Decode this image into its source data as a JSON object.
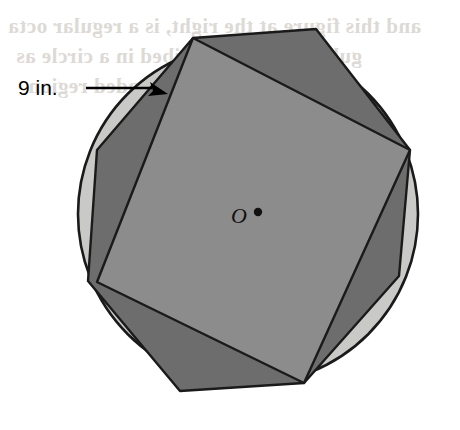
{
  "figure": {
    "background_color": "#ffffff",
    "outline_color": "#1a1a1a",
    "circle": {
      "label": "circle-O",
      "center_x": 248,
      "center_y": 214,
      "radius": 170,
      "fill_color": "#c9c9c7",
      "stroke_color": "#1a1a1a",
      "stroke_width": 2.6
    },
    "octagon": {
      "label": "regular-octagon",
      "sides": 8,
      "fill_color": "#6d6d6d",
      "stroke_color": "#1a1a1a",
      "stroke_width": 2.4,
      "rotation_deg": -12,
      "points": "193,38 316,29 410,150 399,276 304,383 180,391 88,281 97,150"
    },
    "square": {
      "label": "inscribed-square",
      "sides": 4,
      "fill_color": "#8c8c8c",
      "stroke_color": "#1a1a1a",
      "stroke_width": 2.4,
      "points": "193,38 410,150 304,383 97,282"
    },
    "center_point": {
      "label": "center-dot",
      "x": 258,
      "y": 212,
      "radius": 4.2,
      "fill_color": "#111111"
    }
  },
  "labels": {
    "dimension": {
      "text": "9 in.",
      "value": 9,
      "unit": "in.",
      "color": "#000000"
    },
    "center": {
      "text": "O",
      "color": "#111111"
    }
  },
  "leader_line": {
    "name": "dimension-leader",
    "stroke_color": "#000000",
    "stroke_width": 2.4,
    "x1": 86,
    "y1": 88,
    "x2": 152,
    "y2": 88,
    "arrow_tip_x": 168,
    "arrow_tip_y": 94,
    "arrow_points": "168,94 150,82 153,91 148,96"
  },
  "bleed_through": {
    "note": "faint mirrored show-through text from reverse page",
    "line1": "and this figure at the right, is a regular octa",
    "line2": "gular octagon inscribed in a circle as",
    "line3": "of the shaded region"
  }
}
